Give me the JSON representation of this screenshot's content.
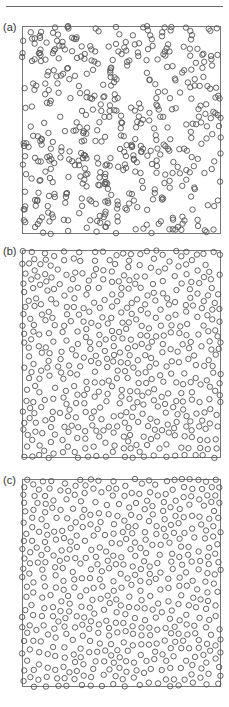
{
  "figure": {
    "header": {
      "cropped_text": "",
      "rule_color": "#6a6a6a"
    },
    "marker": {
      "shape": "open-circle",
      "diameter_px": 5.4,
      "stroke_color": "#555555",
      "frame_color": "#777777"
    },
    "panels": [
      {
        "label": "(a)",
        "arrangement": "random",
        "description": "Uncorrelated random point pattern with clusters and voids",
        "box": {
          "x": 22,
          "y": 26,
          "w": 199,
          "h": 208
        },
        "label_pos": {
          "x": 3,
          "y": 22
        },
        "n_points": 500,
        "min_spacing_px": 0,
        "seed": 11
      },
      {
        "label": "(b)",
        "arrangement": "partially-ordered",
        "description": "More uniform point pattern with short-range exclusion",
        "box": {
          "x": 22,
          "y": 250,
          "w": 199,
          "h": 208
        },
        "label_pos": {
          "x": 3,
          "y": 246
        },
        "n_points": 500,
        "min_spacing_px": 6.4,
        "seed": 23
      },
      {
        "label": "(c)",
        "arrangement": "highly-uniform",
        "description": "Nearly uniform, lattice-like point pattern",
        "box": {
          "x": 22,
          "y": 479,
          "w": 199,
          "h": 208
        },
        "label_pos": {
          "x": 3,
          "y": 475
        },
        "n_points": 500,
        "min_spacing_px": 7.4,
        "seed": 37
      }
    ]
  }
}
